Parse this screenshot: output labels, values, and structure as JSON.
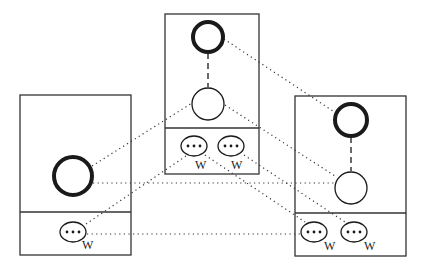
{
  "diagram": {
    "colors": {
      "stroke": "#1a1a1a",
      "background": "#ffffff"
    },
    "boxes": [
      {
        "id": "left",
        "x": 20,
        "y": 95,
        "w": 111,
        "h": 160,
        "divider_y": 212,
        "nodes": [
          {
            "type": "thick-circle",
            "cx": 73,
            "cy": 176,
            "r": 19
          }
        ],
        "ellipses": [
          {
            "cx": 73,
            "cy": 232,
            "label": "W",
            "lx": 82,
            "ly": 249
          }
        ]
      },
      {
        "id": "middle",
        "x": 165,
        "y": 14,
        "w": 94,
        "h": 160,
        "divider_y": 128,
        "nodes": [
          {
            "type": "thick-circle",
            "cx": 208,
            "cy": 37,
            "r": 15
          },
          {
            "type": "thin-circle",
            "cx": 208,
            "cy": 104,
            "r": 16
          }
        ],
        "ellipses": [
          {
            "cx": 194,
            "cy": 146,
            "label": "W",
            "lx": 195,
            "ly": 169
          },
          {
            "cx": 231,
            "cy": 146,
            "label": "W",
            "lx": 231,
            "ly": 169
          }
        ]
      },
      {
        "id": "right",
        "x": 295,
        "y": 96,
        "w": 111,
        "h": 160,
        "divider_y": 213,
        "nodes": [
          {
            "type": "thick-circle",
            "cx": 351,
            "cy": 120,
            "r": 16
          },
          {
            "type": "thin-circle",
            "cx": 351,
            "cy": 188,
            "r": 16
          }
        ],
        "ellipses": [
          {
            "cx": 314,
            "cy": 232,
            "label": "W",
            "lx": 324,
            "ly": 250
          },
          {
            "cx": 354,
            "cy": 232,
            "label": "W",
            "lx": 364,
            "ly": 250
          }
        ]
      }
    ],
    "dashed_links": [
      {
        "x1": 208,
        "y1": 53,
        "x2": 208,
        "y2": 87
      },
      {
        "x1": 351,
        "y1": 137,
        "x2": 351,
        "y2": 171
      }
    ],
    "dotted_links": [
      {
        "from": "left.thick-circle",
        "to": "middle.thin-circle",
        "x1": 92,
        "y1": 166,
        "x2": 192,
        "y2": 103
      },
      {
        "from": "left.thick-circle",
        "to": "right.thin-circle",
        "x1": 93,
        "y1": 183,
        "x2": 334,
        "y2": 183
      },
      {
        "from": "left.ellipse",
        "to": "middle.ellipse-1",
        "x1": 86,
        "y1": 224,
        "x2": 186,
        "y2": 156
      },
      {
        "from": "left.ellipse",
        "to": "right.ellipse-1",
        "x1": 87,
        "y1": 234,
        "x2": 300,
        "y2": 234
      },
      {
        "from": "middle.thick-circle",
        "to": "right.thick-circle",
        "x1": 224,
        "y1": 39,
        "x2": 336,
        "y2": 113
      },
      {
        "from": "middle.thin-circle",
        "to": "right.thin-circle",
        "x1": 225,
        "y1": 105,
        "x2": 335,
        "y2": 176
      },
      {
        "from": "middle.ellipse-1",
        "to": "right.ellipse-1",
        "x1": 205,
        "y1": 155,
        "x2": 305,
        "y2": 222
      },
      {
        "from": "middle.ellipse-2",
        "to": "right.ellipse-2",
        "x1": 244,
        "y1": 155,
        "x2": 345,
        "y2": 222
      }
    ],
    "labels": {
      "w": "W"
    }
  }
}
